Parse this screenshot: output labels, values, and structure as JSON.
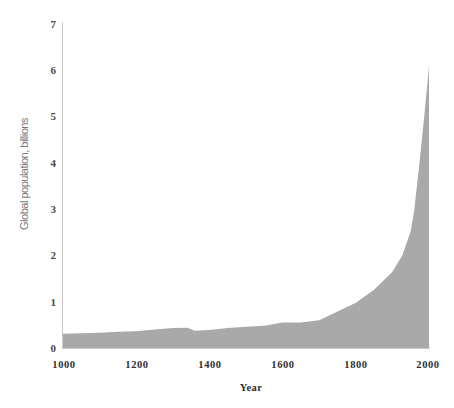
{
  "chart_data": {
    "type": "area",
    "title": "",
    "xlabel": "Year",
    "ylabel": "Global population, billions",
    "xlim": [
      1000,
      2000
    ],
    "ylim": [
      0,
      7
    ],
    "xticks": [
      1000,
      1200,
      1400,
      1600,
      1800,
      2000
    ],
    "yticks": [
      0,
      1,
      2,
      3,
      4,
      5,
      6,
      7
    ],
    "grid": false,
    "legend": null,
    "series_name": "Global population",
    "fill_color": "#a9a9a9",
    "axis_color": "#c9c9c9",
    "tick_label_color": "#2e2e2e",
    "axis_title_color": "#787878",
    "x": [
      1000,
      1050,
      1100,
      1150,
      1200,
      1250,
      1300,
      1340,
      1360,
      1400,
      1450,
      1500,
      1550,
      1600,
      1650,
      1700,
      1750,
      1800,
      1850,
      1900,
      1927,
      1950,
      1960,
      1974,
      1987,
      1999,
      2000
    ],
    "values": [
      0.31,
      0.32,
      0.33,
      0.35,
      0.36,
      0.4,
      0.43,
      0.44,
      0.37,
      0.39,
      0.43,
      0.46,
      0.48,
      0.55,
      0.55,
      0.6,
      0.79,
      0.98,
      1.26,
      1.65,
      2.0,
      2.52,
      3.0,
      4.0,
      5.0,
      6.0,
      6.1
    ]
  },
  "axis": {
    "x_ticks": [
      "1000",
      "1200",
      "1400",
      "1600",
      "1800",
      "2000"
    ],
    "y_ticks": [
      "7",
      "6",
      "5",
      "4",
      "3",
      "2",
      "1",
      "0"
    ],
    "x_title": "Year",
    "y_title": "Global population, billions"
  }
}
